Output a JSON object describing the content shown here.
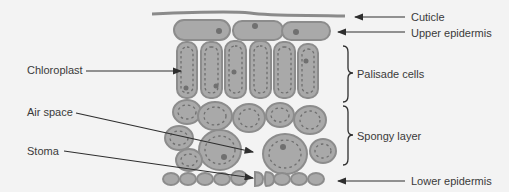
{
  "colors": {
    "background": "#f3f3f3",
    "cell_fill": "#a9a9a9",
    "cell_inner": "#b8b8b8",
    "cell_stroke": "#8c8c8c",
    "cuticle": "#8a8a8a",
    "chloroplast": "#707070",
    "nucleus": "#7a7a7a",
    "label_text": "#3a3a3a",
    "line": "#2e2e2e"
  },
  "labels": {
    "left": [
      {
        "id": "chloroplast",
        "text": "Chloroplast"
      },
      {
        "id": "air_space",
        "text": "Air space"
      },
      {
        "id": "stoma",
        "text": "Stoma"
      }
    ],
    "right": [
      {
        "id": "cuticle",
        "text": "Cuticle"
      },
      {
        "id": "upper_epidermis",
        "text": "Upper epidermis"
      },
      {
        "id": "palisade_cells",
        "text": "Palisade cells"
      },
      {
        "id": "spongy_layer",
        "text": "Spongy layer"
      },
      {
        "id": "lower_epidermis",
        "text": "Lower epidermis"
      }
    ]
  }
}
